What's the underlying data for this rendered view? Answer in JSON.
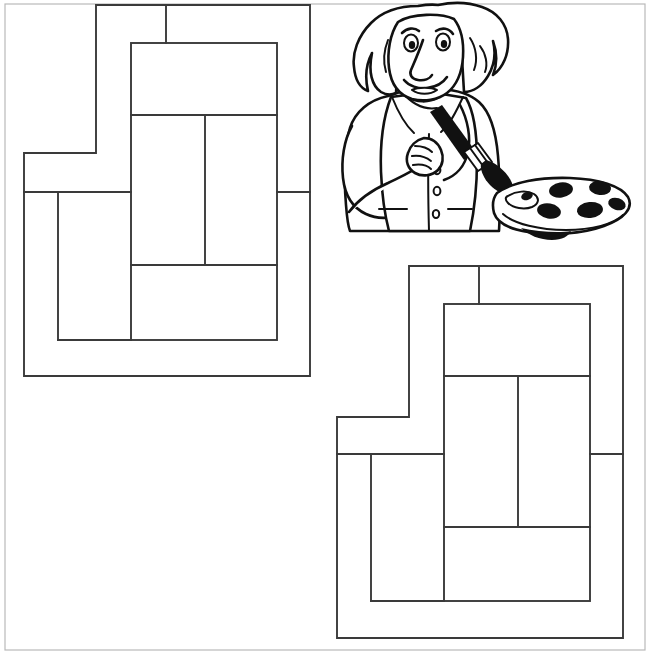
{
  "page": {
    "title": "Coloring Page - Geometric Shape Puzzle with Painter",
    "background_color": "#ffffff",
    "border_color": "#b9b9b9",
    "width": 650,
    "height": 655
  },
  "figures": {
    "stroke_color": "#3a3a3a",
    "fill_color": "#ffffff",
    "ink_color": "#111111",
    "shape_top_left": {
      "name": "geometric-shape-left",
      "label": "Puzzle outline shape, upper left",
      "outline_points": "96,5 310,5 310,376 24,376 24,153 96,153",
      "inner_rect": {
        "x": 131,
        "y": 43,
        "width": 146,
        "height": 297
      },
      "inner_divider_y_top": 115,
      "inner_divider_y_bottom": 265,
      "inner_divider_x": 205,
      "left_cell_line_x": 58,
      "left_cell_line_y": 192,
      "right_notch_line_y": 192,
      "top_stub_x": 166
    },
    "shape_bottom_right": {
      "name": "geometric-shape-right",
      "label": "Puzzle outline shape, lower right",
      "outline_points": "409,266 623,266 623,638 337,638 337,417 409,417",
      "inner_rect": {
        "x": 444,
        "y": 304,
        "width": 146,
        "height": 297
      },
      "inner_divider_y_top": 376,
      "inner_divider_y_bottom": 527,
      "inner_divider_x": 518,
      "left_cell_line_x": 371,
      "left_cell_line_y": 454,
      "right_notch_line_y": 454,
      "top_stub_x": 479
    },
    "painter": {
      "name": "cartoon-painter-einstein",
      "label": "Cartoon scientist painting with brush and palette",
      "items": [
        "hair",
        "face",
        "eyes",
        "eyebrows",
        "nose",
        "mustache",
        "mouth",
        "jacket",
        "shirt",
        "buttons",
        "hand",
        "paintbrush",
        "palette",
        "paint-blobs"
      ],
      "paint_blob_count": 6
    }
  }
}
